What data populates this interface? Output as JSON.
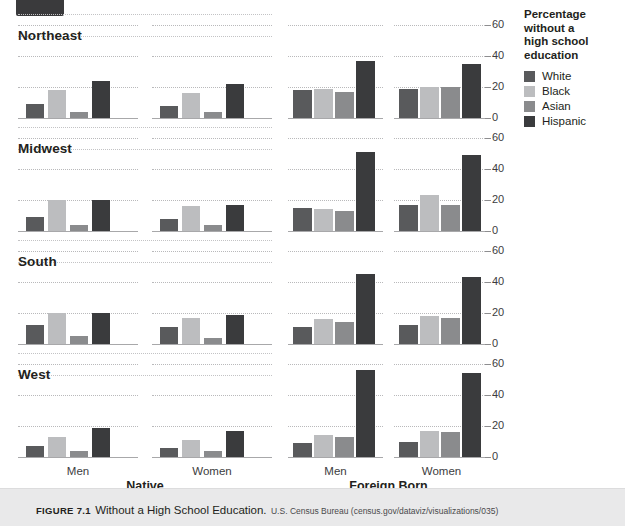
{
  "page_tab": {
    "label": ""
  },
  "caption": {
    "figure_number": "FIGURE 7.1",
    "title": "Without a High School Education.",
    "source": "U.S. Census Bureau (census.gov/dataviz/visualizations/035)"
  },
  "legend": {
    "title": "Percentage without a high school education",
    "title_lines": [
      "Percentage",
      "without a",
      "high school",
      "education"
    ],
    "items": [
      {
        "label": "White",
        "color": "#595a5c"
      },
      {
        "label": "Black",
        "color": "#bcbdbf"
      },
      {
        "label": "Asian",
        "color": "#8a8b8d"
      },
      {
        "label": "Hispanic",
        "color": "#3a3b3d"
      }
    ]
  },
  "axis": {
    "yticks": [
      0,
      20,
      40,
      60
    ],
    "ytick_labels": [
      "0",
      "20",
      "40",
      "60"
    ],
    "ylim": [
      0,
      60
    ],
    "x_sublabels": [
      "Men",
      "Women"
    ],
    "x_grouplabels": [
      "Native",
      "Foreign Born"
    ]
  },
  "chart_data": {
    "type": "bar",
    "title": "Without a High School Education",
    "subtitle": "Percentage without a high school education",
    "xlabel": "",
    "ylabel": "Percentage without a high school education",
    "ylim": [
      0,
      60
    ],
    "yticks": [
      0,
      20,
      40,
      60
    ],
    "grid": true,
    "legend_position": "right",
    "layout": "small-multiples 4 regions x 2 nativity x 2 sex",
    "series_names": [
      "White",
      "Black",
      "Asian",
      "Hispanic"
    ],
    "series_colors": [
      "#595a5c",
      "#bcbdbf",
      "#8a8b8d",
      "#3a3b3d"
    ],
    "regions": [
      "Northeast",
      "Midwest",
      "South",
      "West"
    ],
    "nativity": [
      "Native",
      "Foreign Born"
    ],
    "sex": [
      "Men",
      "Women"
    ],
    "panels": [
      {
        "region": "Northeast",
        "nativity": "Native",
        "sex": "Men",
        "categories": [
          "White",
          "Black",
          "Asian",
          "Hispanic"
        ],
        "values": [
          9,
          18,
          4,
          24
        ]
      },
      {
        "region": "Northeast",
        "nativity": "Native",
        "sex": "Women",
        "categories": [
          "White",
          "Black",
          "Asian",
          "Hispanic"
        ],
        "values": [
          8,
          16,
          4,
          22
        ]
      },
      {
        "region": "Northeast",
        "nativity": "Foreign Born",
        "sex": "Men",
        "categories": [
          "White",
          "Black",
          "Asian",
          "Hispanic"
        ],
        "values": [
          18,
          19,
          17,
          37
        ]
      },
      {
        "region": "Northeast",
        "nativity": "Foreign Born",
        "sex": "Women",
        "categories": [
          "White",
          "Black",
          "Asian",
          "Hispanic"
        ],
        "values": [
          19,
          20,
          20,
          35
        ]
      },
      {
        "region": "Midwest",
        "nativity": "Native",
        "sex": "Men",
        "categories": [
          "White",
          "Black",
          "Asian",
          "Hispanic"
        ],
        "values": [
          9,
          20,
          4,
          20
        ]
      },
      {
        "region": "Midwest",
        "nativity": "Native",
        "sex": "Women",
        "categories": [
          "White",
          "Black",
          "Asian",
          "Hispanic"
        ],
        "values": [
          8,
          16,
          4,
          17
        ]
      },
      {
        "region": "Midwest",
        "nativity": "Foreign Born",
        "sex": "Men",
        "categories": [
          "White",
          "Black",
          "Asian",
          "Hispanic"
        ],
        "values": [
          15,
          14,
          13,
          51
        ]
      },
      {
        "region": "Midwest",
        "nativity": "Foreign Born",
        "sex": "Women",
        "categories": [
          "White",
          "Black",
          "Asian",
          "Hispanic"
        ],
        "values": [
          17,
          23,
          17,
          49
        ]
      },
      {
        "region": "South",
        "nativity": "Native",
        "sex": "Men",
        "categories": [
          "White",
          "Black",
          "Asian",
          "Hispanic"
        ],
        "values": [
          12,
          20,
          5,
          20
        ]
      },
      {
        "region": "South",
        "nativity": "Native",
        "sex": "Women",
        "categories": [
          "White",
          "Black",
          "Asian",
          "Hispanic"
        ],
        "values": [
          11,
          17,
          4,
          19
        ]
      },
      {
        "region": "South",
        "nativity": "Foreign Born",
        "sex": "Men",
        "categories": [
          "White",
          "Black",
          "Asian",
          "Hispanic"
        ],
        "values": [
          11,
          16,
          14,
          45
        ]
      },
      {
        "region": "South",
        "nativity": "Foreign Born",
        "sex": "Women",
        "categories": [
          "White",
          "Black",
          "Asian",
          "Hispanic"
        ],
        "values": [
          12,
          18,
          17,
          43
        ]
      },
      {
        "region": "West",
        "nativity": "Native",
        "sex": "Men",
        "categories": [
          "White",
          "Black",
          "Asian",
          "Hispanic"
        ],
        "values": [
          7,
          13,
          4,
          19
        ]
      },
      {
        "region": "West",
        "nativity": "Native",
        "sex": "Women",
        "categories": [
          "White",
          "Black",
          "Asian",
          "Hispanic"
        ],
        "values": [
          6,
          11,
          4,
          17
        ]
      },
      {
        "region": "West",
        "nativity": "Foreign Born",
        "sex": "Men",
        "categories": [
          "White",
          "Black",
          "Asian",
          "Hispanic"
        ],
        "values": [
          9,
          14,
          13,
          56
        ]
      },
      {
        "region": "West",
        "nativity": "Foreign Born",
        "sex": "Women",
        "categories": [
          "White",
          "Black",
          "Asian",
          "Hispanic"
        ],
        "values": [
          10,
          17,
          16,
          54
        ]
      }
    ]
  }
}
